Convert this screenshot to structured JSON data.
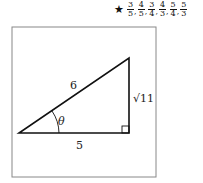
{
  "answer": {
    "marker": "★",
    "fractions": [
      {
        "num": "3",
        "den": "5"
      },
      {
        "num": "4",
        "den": "5"
      },
      {
        "num": "3",
        "den": "4"
      },
      {
        "num": "4",
        "den": "3"
      },
      {
        "num": "5",
        "den": "4"
      },
      {
        "num": "5",
        "den": "3"
      }
    ]
  },
  "diagram": {
    "hypotenuse_label": "6",
    "adjacent_label": "5",
    "opposite_label": "√11",
    "angle_label": "θ"
  }
}
